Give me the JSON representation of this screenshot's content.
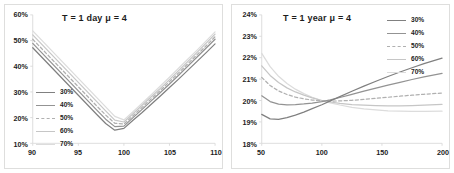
{
  "figure": {
    "background": "#ffffff",
    "panel_border_color": "#dededd",
    "axis_color": "#d9d9d9",
    "text_color": "#1c1c1c"
  },
  "chart_data": [
    {
      "type": "line",
      "panel": "left",
      "title": "T = 1 day  μ = 4",
      "xlabel": "",
      "ylabel": "",
      "xlim": [
        90,
        110
      ],
      "ylim": [
        0.1,
        0.6
      ],
      "xticks": [
        90,
        95,
        100,
        105,
        110
      ],
      "xtick_labels": [
        "90",
        "95",
        "100",
        "105",
        "110"
      ],
      "yticks": [
        0.1,
        0.2,
        0.3,
        0.4,
        0.5,
        0.6
      ],
      "ytick_labels": [
        "10%",
        "20%",
        "30%",
        "40%",
        "50%",
        "60%"
      ],
      "grid": false,
      "legend_position": "center-left",
      "x": [
        90,
        91,
        92,
        93,
        94,
        95,
        96,
        97,
        98,
        99,
        100,
        101,
        102,
        103,
        104,
        105,
        106,
        107,
        108,
        109,
        110
      ],
      "series": [
        {
          "name": "30%",
          "color": "#808080",
          "style": "solid",
          "values": [
            0.472,
            0.435,
            0.398,
            0.361,
            0.324,
            0.287,
            0.25,
            0.213,
            0.177,
            0.151,
            0.158,
            0.19,
            0.22,
            0.252,
            0.284,
            0.317,
            0.35,
            0.384,
            0.418,
            0.452,
            0.487
          ]
        },
        {
          "name": "40%",
          "color": "#939393",
          "style": "solid",
          "values": [
            0.489,
            0.452,
            0.415,
            0.378,
            0.341,
            0.304,
            0.267,
            0.23,
            0.194,
            0.165,
            0.167,
            0.2,
            0.232,
            0.265,
            0.298,
            0.331,
            0.365,
            0.4,
            0.435,
            0.47,
            0.505
          ]
        },
        {
          "name": "50%",
          "color": "#b0b0b0",
          "style": "dashed",
          "values": [
            0.505,
            0.468,
            0.431,
            0.394,
            0.357,
            0.32,
            0.283,
            0.246,
            0.21,
            0.178,
            0.175,
            0.207,
            0.24,
            0.273,
            0.306,
            0.34,
            0.374,
            0.409,
            0.444,
            0.479,
            0.515
          ]
        },
        {
          "name": "60%",
          "color": "#c6c6c6",
          "style": "solid",
          "values": [
            0.522,
            0.485,
            0.448,
            0.411,
            0.374,
            0.337,
            0.3,
            0.263,
            0.226,
            0.19,
            0.183,
            0.215,
            0.248,
            0.281,
            0.314,
            0.348,
            0.383,
            0.418,
            0.453,
            0.489,
            0.525
          ]
        },
        {
          "name": "70%",
          "color": "#dcdcdc",
          "style": "solid",
          "values": [
            0.538,
            0.501,
            0.464,
            0.427,
            0.39,
            0.353,
            0.316,
            0.279,
            0.242,
            0.205,
            0.191,
            0.223,
            0.256,
            0.289,
            0.323,
            0.357,
            0.392,
            0.427,
            0.462,
            0.498,
            0.534
          ]
        }
      ]
    },
    {
      "type": "line",
      "panel": "right",
      "title": "T = 1 year  μ = 4",
      "xlabel": "",
      "ylabel": "",
      "xlim": [
        50,
        200
      ],
      "ylim": [
        0.18,
        0.24
      ],
      "xticks": [
        50,
        100,
        150,
        200
      ],
      "xtick_labels": [
        "50",
        "100",
        "150",
        "200"
      ],
      "yticks": [
        0.18,
        0.19,
        0.2,
        0.21,
        0.22,
        0.23,
        0.24
      ],
      "ytick_labels": [
        "18%",
        "19%",
        "20%",
        "21%",
        "22%",
        "23%",
        "24%"
      ],
      "grid": false,
      "legend_position": "top-right",
      "x": [
        50,
        57,
        64,
        71,
        78,
        85,
        92,
        100,
        107,
        115,
        125,
        135,
        145,
        155,
        165,
        175,
        185,
        200
      ],
      "series": [
        {
          "name": "30%",
          "color": "#808080",
          "style": "solid",
          "values": [
            0.1935,
            0.1914,
            0.1912,
            0.192,
            0.1932,
            0.1946,
            0.1962,
            0.198,
            0.1998,
            0.2018,
            0.2043,
            0.2067,
            0.209,
            0.2112,
            0.2133,
            0.2153,
            0.2172,
            0.2198
          ]
        },
        {
          "name": "40%",
          "color": "#939393",
          "style": "solid",
          "values": [
            0.2022,
            0.1995,
            0.1983,
            0.198,
            0.1981,
            0.1984,
            0.1988,
            0.1995,
            0.2003,
            0.2014,
            0.2029,
            0.2044,
            0.2058,
            0.2072,
            0.2085,
            0.2098,
            0.211,
            0.2127
          ]
        },
        {
          "name": "50%",
          "color": "#b0b0b0",
          "style": "dashed",
          "values": [
            0.2108,
            0.207,
            0.2045,
            0.2028,
            0.2016,
            0.2008,
            0.2002,
            0.1998,
            0.1997,
            0.1998,
            0.2001,
            0.2005,
            0.201,
            0.2015,
            0.202,
            0.2025,
            0.2029,
            0.2035
          ]
        },
        {
          "name": "60%",
          "color": "#c6c6c6",
          "style": "solid",
          "values": [
            0.2162,
            0.2117,
            0.2084,
            0.2059,
            0.204,
            0.2025,
            0.2012,
            0.2,
            0.1993,
            0.1987,
            0.1981,
            0.1978,
            0.1976,
            0.1975,
            0.1975,
            0.1976,
            0.1978,
            0.1982
          ]
        },
        {
          "name": "70%",
          "color": "#dcdcdc",
          "style": "solid",
          "values": [
            0.222,
            0.2158,
            0.2113,
            0.2079,
            0.2053,
            0.2032,
            0.2015,
            0.2,
            0.1989,
            0.1979,
            0.1968,
            0.1961,
            0.1956,
            0.1952,
            0.195,
            0.1949,
            0.1949,
            0.195
          ]
        }
      ]
    }
  ]
}
